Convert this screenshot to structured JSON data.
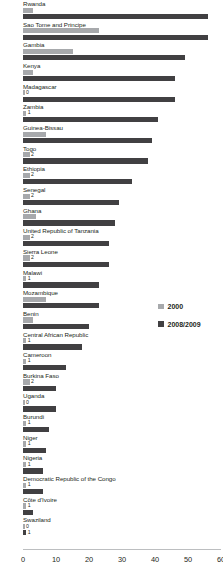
{
  "chart_data": {
    "type": "bar",
    "orientation": "horizontal",
    "title": "",
    "subtitle": "",
    "xlabel": "",
    "ylabel": "",
    "xlim": [
      0,
      60
    ],
    "xticks": [
      0,
      10,
      20,
      30,
      40,
      50,
      60
    ],
    "grid": false,
    "legend_position": "right",
    "categories": [
      "Rwanda",
      "Sao Tome and Principe",
      "Gambia",
      "Kenya",
      "Madagascar",
      "Zambia",
      "Guinea-Bissau",
      "Togo",
      "Ethiopia",
      "Senegal",
      "Ghana",
      "United Republic of Tanzania",
      "Sierra Leone",
      "Malawi",
      "Mozambique",
      "Benin",
      "Central African Republic",
      "Cameroon",
      "Burkina Faso",
      "Uganda",
      "Burundi",
      "Niger",
      "Nigeria",
      "Democratic Republic of the Congo",
      "Côte d'Ivoire",
      "Swaziland"
    ],
    "series": [
      {
        "name": "2000",
        "color": "#a7a9ac",
        "values": [
          3,
          23,
          15,
          3,
          0,
          1,
          7,
          2,
          2,
          2,
          4,
          2,
          2,
          1,
          7,
          3,
          1,
          1,
          2,
          0,
          1,
          1,
          1,
          1,
          1,
          0
        ]
      },
      {
        "name": "2008/2009",
        "color": "#414042",
        "values": [
          56,
          56,
          49,
          46,
          46,
          41,
          39,
          38,
          33,
          29,
          28,
          26,
          26,
          23,
          23,
          20,
          18,
          13,
          10,
          10,
          8,
          7,
          6,
          6,
          3,
          1
        ]
      }
    ]
  },
  "legend": {
    "items": [
      {
        "label": "2000",
        "swatch_name": "legend-swatch-2000"
      },
      {
        "label": "2008/2009",
        "swatch_name": "legend-swatch-2008-2009"
      }
    ]
  },
  "axis": {
    "tick_labels": [
      "0",
      "10",
      "20",
      "30",
      "40",
      "50",
      "60"
    ]
  }
}
